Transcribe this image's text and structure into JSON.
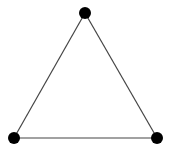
{
  "diagram": {
    "type": "graph",
    "colors": {
      "background": "#ffffff",
      "node": "#000000",
      "edge": "#444444"
    },
    "node_radius": 6,
    "nodes": [
      {
        "id": "top",
        "x": 85,
        "y": 13
      },
      {
        "id": "bottom-left",
        "x": 14,
        "y": 138
      },
      {
        "id": "bottom-right",
        "x": 157,
        "y": 138
      }
    ],
    "edges": [
      {
        "from": "top",
        "to": "bottom-left"
      },
      {
        "from": "top",
        "to": "bottom-right"
      },
      {
        "from": "bottom-left",
        "to": "bottom-right"
      }
    ]
  }
}
